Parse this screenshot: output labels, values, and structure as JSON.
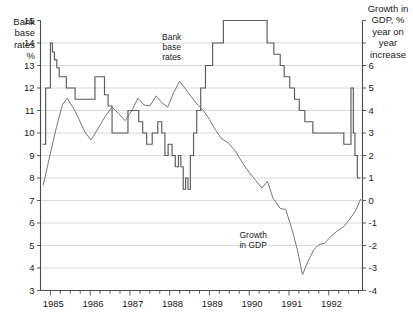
{
  "chart_data": {
    "type": "line",
    "title": "",
    "xlabel": "",
    "x_tick_labels": [
      "1985",
      "1986",
      "1987",
      "1988",
      "1989",
      "1990",
      "1991",
      "1992"
    ],
    "x_minor_ticks_per_year": 4,
    "xlim": [
      1984.75,
      1992.85
    ],
    "left_axis": {
      "label": "Bank base rates %",
      "label_lines": [
        "Bank",
        "base",
        "rates",
        "%"
      ],
      "ticks": [
        15,
        14,
        13,
        12,
        11,
        10,
        9,
        8,
        7,
        6,
        5,
        4,
        3
      ],
      "ylim": [
        3,
        15
      ]
    },
    "right_axis": {
      "label": "Growth in GDP, % year on year increase",
      "label_lines": [
        "Growth in",
        "GDP, %",
        "year on",
        "year",
        "increase"
      ],
      "ticks": [
        6,
        5,
        4,
        3,
        2,
        1,
        0,
        -1,
        -2,
        -3,
        -4
      ],
      "ylim": [
        -4,
        8
      ]
    },
    "annotations": [
      {
        "name": "bank-base-rates-label",
        "lines": [
          "Bank",
          "base",
          "rates"
        ],
        "x": 1988.05,
        "y_left": 14.15
      },
      {
        "name": "growth-in-gdp-label",
        "lines": [
          "Growth",
          "in GDP"
        ],
        "x": 1990.1,
        "y_left": 5.35
      }
    ],
    "series": [
      {
        "name": "Bank base rates",
        "axis": "left",
        "style": "step",
        "units": "%",
        "points": [
          [
            1984.8,
            9.5
          ],
          [
            1984.88,
            9.5
          ],
          [
            1984.88,
            12.0
          ],
          [
            1985.0,
            12.0
          ],
          [
            1985.0,
            14.0
          ],
          [
            1985.05,
            14.0
          ],
          [
            1985.05,
            13.6
          ],
          [
            1985.1,
            13.6
          ],
          [
            1985.1,
            13.25
          ],
          [
            1985.16,
            13.25
          ],
          [
            1985.16,
            12.9
          ],
          [
            1985.22,
            12.9
          ],
          [
            1985.22,
            12.5
          ],
          [
            1985.4,
            12.5
          ],
          [
            1985.4,
            12.0
          ],
          [
            1985.62,
            12.0
          ],
          [
            1985.62,
            11.5
          ],
          [
            1986.12,
            11.5
          ],
          [
            1986.12,
            12.5
          ],
          [
            1986.36,
            12.5
          ],
          [
            1986.36,
            11.7
          ],
          [
            1986.45,
            11.7
          ],
          [
            1986.45,
            11.2
          ],
          [
            1986.55,
            11.2
          ],
          [
            1986.55,
            10.0
          ],
          [
            1986.95,
            10.0
          ],
          [
            1986.95,
            11.0
          ],
          [
            1987.22,
            11.0
          ],
          [
            1987.22,
            10.5
          ],
          [
            1987.32,
            10.5
          ],
          [
            1987.32,
            10.0
          ],
          [
            1987.42,
            10.0
          ],
          [
            1987.42,
            9.5
          ],
          [
            1987.56,
            9.5
          ],
          [
            1987.56,
            10.0
          ],
          [
            1987.7,
            10.0
          ],
          [
            1987.7,
            10.5
          ],
          [
            1987.8,
            10.5
          ],
          [
            1987.8,
            10.0
          ],
          [
            1987.88,
            10.0
          ],
          [
            1987.88,
            9.0
          ],
          [
            1987.96,
            9.0
          ],
          [
            1987.96,
            9.5
          ],
          [
            1988.06,
            9.5
          ],
          [
            1988.06,
            9.0
          ],
          [
            1988.14,
            9.0
          ],
          [
            1988.14,
            8.5
          ],
          [
            1988.22,
            8.5
          ],
          [
            1988.22,
            9.0
          ],
          [
            1988.28,
            9.0
          ],
          [
            1988.28,
            8.5
          ],
          [
            1988.34,
            8.5
          ],
          [
            1988.34,
            7.5
          ],
          [
            1988.4,
            7.5
          ],
          [
            1988.4,
            8.0
          ],
          [
            1988.46,
            8.0
          ],
          [
            1988.46,
            7.5
          ],
          [
            1988.52,
            7.5
          ],
          [
            1988.52,
            9.0
          ],
          [
            1988.6,
            9.0
          ],
          [
            1988.6,
            10.0
          ],
          [
            1988.68,
            10.0
          ],
          [
            1988.68,
            11.0
          ],
          [
            1988.78,
            11.0
          ],
          [
            1988.78,
            12.0
          ],
          [
            1988.9,
            12.0
          ],
          [
            1988.9,
            13.0
          ],
          [
            1989.08,
            13.0
          ],
          [
            1989.08,
            14.0
          ],
          [
            1989.35,
            14.0
          ],
          [
            1989.35,
            15.0
          ],
          [
            1990.45,
            15.0
          ],
          [
            1990.45,
            14.0
          ],
          [
            1990.62,
            14.0
          ],
          [
            1990.62,
            13.5
          ],
          [
            1990.78,
            13.5
          ],
          [
            1990.78,
            13.0
          ],
          [
            1990.88,
            13.0
          ],
          [
            1990.88,
            12.5
          ],
          [
            1991.02,
            12.5
          ],
          [
            1991.02,
            12.0
          ],
          [
            1991.14,
            12.0
          ],
          [
            1991.14,
            11.5
          ],
          [
            1991.26,
            11.5
          ],
          [
            1991.26,
            11.0
          ],
          [
            1991.4,
            11.0
          ],
          [
            1991.4,
            10.5
          ],
          [
            1991.6,
            10.5
          ],
          [
            1991.6,
            10.0
          ],
          [
            1992.38,
            10.0
          ],
          [
            1992.38,
            9.5
          ],
          [
            1992.56,
            9.5
          ],
          [
            1992.56,
            12.0
          ],
          [
            1992.62,
            12.0
          ],
          [
            1992.62,
            10.0
          ],
          [
            1992.66,
            10.0
          ],
          [
            1992.66,
            9.0
          ],
          [
            1992.72,
            9.0
          ],
          [
            1992.72,
            8.0
          ],
          [
            1992.8,
            8.0
          ]
        ]
      },
      {
        "name": "Growth in GDP",
        "axis": "right",
        "style": "line",
        "units": "% year on year",
        "points": [
          [
            1984.82,
            0.7
          ],
          [
            1985.0,
            2.1
          ],
          [
            1985.15,
            3.25
          ],
          [
            1985.3,
            4.25
          ],
          [
            1985.42,
            4.55
          ],
          [
            1985.58,
            4.1
          ],
          [
            1985.72,
            3.6
          ],
          [
            1985.88,
            3.0
          ],
          [
            1986.02,
            2.7
          ],
          [
            1986.2,
            3.2
          ],
          [
            1986.38,
            3.75
          ],
          [
            1986.55,
            4.15
          ],
          [
            1986.72,
            3.85
          ],
          [
            1986.88,
            3.55
          ],
          [
            1987.05,
            4.0
          ],
          [
            1987.2,
            4.55
          ],
          [
            1987.35,
            4.25
          ],
          [
            1987.5,
            4.2
          ],
          [
            1987.66,
            4.65
          ],
          [
            1987.8,
            4.35
          ],
          [
            1987.95,
            4.15
          ],
          [
            1988.1,
            4.8
          ],
          [
            1988.25,
            5.3
          ],
          [
            1988.4,
            4.95
          ],
          [
            1988.55,
            4.6
          ],
          [
            1988.7,
            4.25
          ],
          [
            1988.85,
            4.0
          ],
          [
            1989.0,
            3.6
          ],
          [
            1989.15,
            3.15
          ],
          [
            1989.3,
            2.75
          ],
          [
            1989.48,
            2.55
          ],
          [
            1989.65,
            2.2
          ],
          [
            1989.82,
            1.7
          ],
          [
            1990.0,
            1.25
          ],
          [
            1990.16,
            0.9
          ],
          [
            1990.32,
            0.55
          ],
          [
            1990.46,
            0.85
          ],
          [
            1990.6,
            0.1
          ],
          [
            1990.78,
            -0.35
          ],
          [
            1990.92,
            -0.4
          ],
          [
            1991.08,
            -1.3
          ],
          [
            1991.22,
            -2.25
          ],
          [
            1991.34,
            -3.3
          ],
          [
            1991.48,
            -2.7
          ],
          [
            1991.62,
            -2.2
          ],
          [
            1991.76,
            -1.95
          ],
          [
            1991.9,
            -1.9
          ],
          [
            1992.05,
            -1.6
          ],
          [
            1992.22,
            -1.35
          ],
          [
            1992.38,
            -1.15
          ],
          [
            1992.52,
            -0.85
          ],
          [
            1992.68,
            -0.45
          ],
          [
            1992.8,
            0.05
          ]
        ]
      }
    ]
  }
}
